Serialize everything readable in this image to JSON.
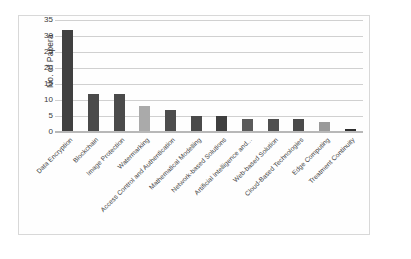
{
  "chart_data": {
    "type": "bar",
    "title": "",
    "subtitle": "",
    "xlabel": "",
    "ylabel": "No. of Papera",
    "ylim": [
      0,
      35
    ],
    "ytick_step": 5,
    "yticks": [
      "35",
      "30",
      "25",
      "20",
      "15",
      "10",
      "5",
      "0"
    ],
    "grid": true,
    "legend": false,
    "orientation": "vertical",
    "categories": [
      "Data Encryption",
      "Blockchain",
      "Image Protection",
      "Watermarking",
      "Access Control and Authentication",
      "Mathematical Modelling",
      "Network-based Solutions",
      "Artificial Intelligence and...",
      "Web-based Solution",
      "Cloud-Based Technologies",
      "Edge Computing",
      "Treatment Continuity"
    ],
    "values": [
      32,
      12,
      12,
      8,
      7,
      5,
      5,
      4,
      4,
      4,
      3,
      1
    ],
    "bar_colors": [
      "#404040",
      "#4a4a4a",
      "#4a4a4a",
      "#aaaaaa",
      "#4d4d4d",
      "#4a4a4a",
      "#3f3f3f",
      "#5a5a5a",
      "#4f4f4f",
      "#4a4a4a",
      "#9a9a9a",
      "#2e2e2e"
    ],
    "colors": {
      "background": "#ffffff",
      "plot_background": "#fefefe",
      "frame_border": "#d8d8d8",
      "gridline": "#d0d0d0",
      "axis_line": "#b8b8b8",
      "tick_text": "#3a3a3a",
      "label_text": "#3d3d3d"
    }
  }
}
